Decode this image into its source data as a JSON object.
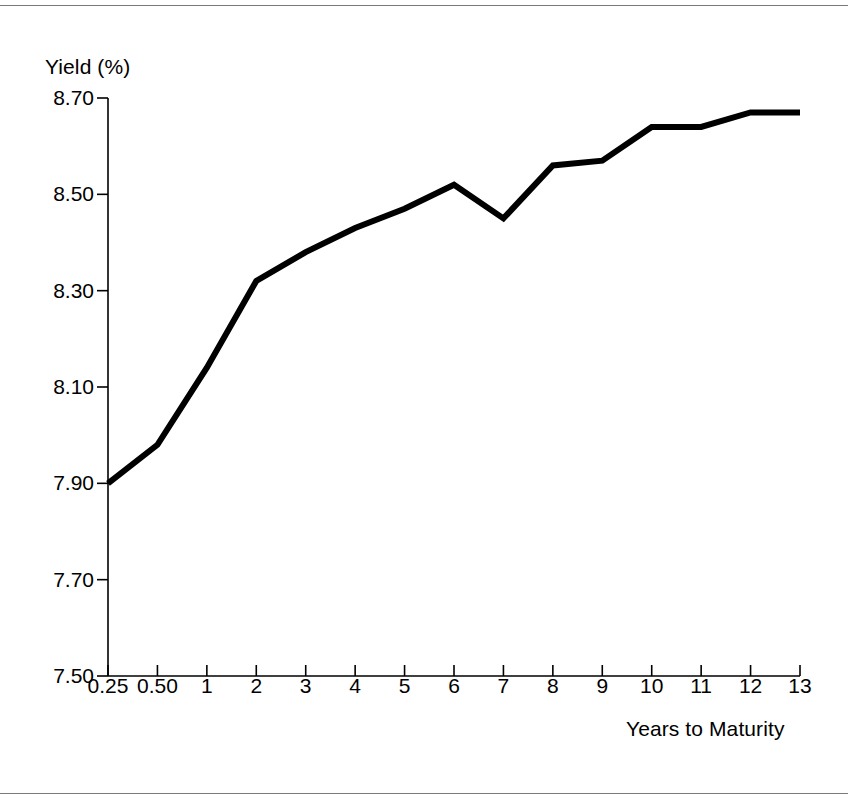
{
  "chart_data": {
    "type": "line",
    "title": "",
    "xlabel": "Years to Maturity",
    "ylabel": "Yield (%)",
    "categories": [
      "0.25",
      "0.50",
      "1",
      "2",
      "3",
      "4",
      "5",
      "6",
      "7",
      "8",
      "9",
      "10",
      "11",
      "12",
      "13"
    ],
    "values": [
      7.9,
      7.98,
      8.14,
      8.32,
      8.38,
      8.43,
      8.47,
      8.52,
      8.45,
      8.56,
      8.57,
      8.64,
      8.64,
      8.67,
      8.67
    ],
    "yticks": [
      "7.50",
      "7.70",
      "7.90",
      "8.10",
      "8.30",
      "8.50",
      "8.70"
    ],
    "ytick_values": [
      7.5,
      7.7,
      7.9,
      8.1,
      8.3,
      8.5,
      8.7
    ],
    "ylim": [
      7.5,
      8.7
    ],
    "grid": false,
    "legend": false,
    "line_color": "#000000",
    "line_width": 6,
    "axis_color": "#000000",
    "background": "#ffffff"
  },
  "figure": {
    "rule_color": "#7a7a7a"
  }
}
